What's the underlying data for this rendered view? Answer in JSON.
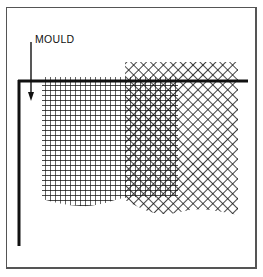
{
  "diagram": {
    "label": "MOULD",
    "colors": {
      "ink": "#111111",
      "frame": "#555555",
      "background": "#ffffff"
    },
    "elements": [
      {
        "type": "arrow",
        "direction": "down",
        "points_to": "mould"
      },
      {
        "type": "mould-frame",
        "description": "L-shaped mould wire (top horizontal + left vertical)"
      },
      {
        "type": "square-mesh",
        "description": "square grid pattern"
      },
      {
        "type": "diagonal-mesh",
        "description": "diagonal (cross-hatched) grid pattern"
      },
      {
        "type": "overlap",
        "description": "moiré overlap of square and diagonal meshes"
      }
    ]
  }
}
